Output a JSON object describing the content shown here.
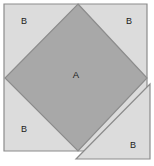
{
  "figure": {
    "canvas": {
      "width": 154,
      "height": 166,
      "background": "#ffffff"
    },
    "colors": {
      "outer_square_fill": "#dcdcdc",
      "inner_diamond_fill": "#a8a8a8",
      "detached_triangle_fill": "#dcdcdc",
      "stroke": "#8c8c8c",
      "label_text": "#1a1a1a"
    },
    "shapes": {
      "outer_square": {
        "name": "outer-square",
        "points": "4,4 147,4 147,151 4,151",
        "fill": "#dcdcdc"
      },
      "inner_diamond": {
        "name": "inner-diamond",
        "label": "A",
        "points": "78,4 147,78 78,151 5,78",
        "fill": "#a8a8a8",
        "label_x": 76,
        "label_y": 75
      },
      "detached_triangle": {
        "name": "detached-triangle",
        "label": "B",
        "points": "150,84 150,159 76,159",
        "fill": "#dcdcdc",
        "label_x": 133,
        "label_y": 146
      }
    },
    "corner_labels": [
      {
        "id": "corner-b-top-left",
        "text": "B",
        "x": 24,
        "y": 22
      },
      {
        "id": "corner-b-top-right",
        "text": "B",
        "x": 129,
        "y": 22
      },
      {
        "id": "corner-b-bottom-left",
        "text": "B",
        "x": 24,
        "y": 130
      }
    ],
    "center_label": {
      "id": "center-a",
      "text": "A"
    }
  }
}
